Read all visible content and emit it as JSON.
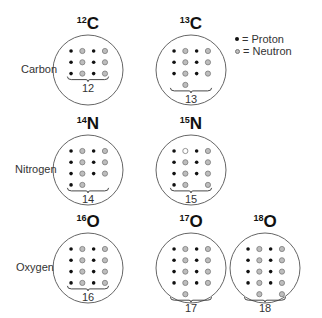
{
  "legend": {
    "proton_label": "= Proton",
    "neutron_label": "= Neutron"
  },
  "rows": [
    {
      "label": "Carbon",
      "y": 70
    },
    {
      "label": "Nitrogen",
      "y": 170
    },
    {
      "label": "Oxygen",
      "y": 268
    }
  ],
  "colors": {
    "proton": "#111111",
    "neutron_fill": "#bdbdbd",
    "neutron_stroke": "#7a7a7a",
    "circle_stroke": "#666666",
    "text": "#111111"
  },
  "isotopes": [
    {
      "mass": "12",
      "symbol": "C",
      "element": "Carbon",
      "cx": 88,
      "cy": 70,
      "protons": 6,
      "neutrons": 6,
      "total": "12",
      "grid": [
        "PNPN",
        "PNPN",
        "PNPN"
      ]
    },
    {
      "mass": "13",
      "symbol": "C",
      "element": "Carbon",
      "cx": 191,
      "cy": 70,
      "protons": 6,
      "neutrons": 7,
      "total": "13",
      "grid": [
        "PNPN",
        "PNPN",
        "PNPN",
        ".N.."
      ]
    },
    {
      "mass": "14",
      "symbol": "N",
      "element": "Nitrogen",
      "cx": 88,
      "cy": 170,
      "protons": 7,
      "neutrons": 7,
      "total": "14",
      "grid": [
        "PNPN",
        "PNPN",
        "PNPN",
        "PN.."
      ]
    },
    {
      "mass": "15",
      "symbol": "N",
      "element": "Nitrogen",
      "cx": 191,
      "cy": 170,
      "protons": 7,
      "neutrons": 8,
      "total": "15",
      "grid": [
        "POPN",
        "PNPN",
        "PNPN",
        "PN.N"
      ]
    },
    {
      "mass": "16",
      "symbol": "O",
      "element": "Oxygen",
      "cx": 88,
      "cy": 268,
      "protons": 8,
      "neutrons": 8,
      "total": "16",
      "grid": [
        "PNPN",
        "PNPN",
        "PNPN",
        "PNPN"
      ]
    },
    {
      "mass": "17",
      "symbol": "O",
      "element": "Oxygen",
      "cx": 191,
      "cy": 268,
      "protons": 8,
      "neutrons": 9,
      "total": "17",
      "grid": [
        "PNPN",
        "PNPN",
        "PNPN",
        "PNPN",
        ".N.."
      ]
    },
    {
      "mass": "18",
      "symbol": "O",
      "element": "Oxygen",
      "cx": 265,
      "cy": 268,
      "protons": 8,
      "neutrons": 10,
      "total": "18",
      "grid": [
        "PNPN",
        "PNPN",
        "PNPN",
        "PNPN",
        ".N.N"
      ]
    }
  ]
}
